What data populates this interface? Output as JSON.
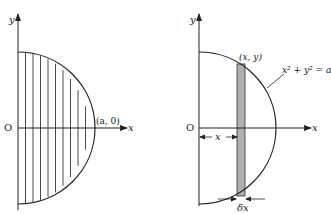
{
  "left_figure": {
    "y_axis_label": "y",
    "x_axis_label": "x",
    "origin_label": "O",
    "point_label": "(a, 0)",
    "strip_count": 10
  },
  "right_figure": {
    "y_axis_label": "y",
    "x_axis_label": "x",
    "origin_label": "O",
    "point_label": "(x, y)",
    "equation_label": "x² + y² = a",
    "distance_label": "x",
    "width_label": "δx"
  },
  "colors": {
    "line": "#222222",
    "strip_fill": "#b0b0b0"
  }
}
